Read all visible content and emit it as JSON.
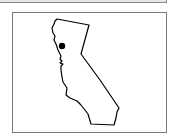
{
  "map": {
    "region": "California",
    "outline_color": "#000000",
    "marker": {
      "shape": "dot",
      "color": "#000000",
      "x": 62,
      "y": 46,
      "r": 3
    }
  }
}
